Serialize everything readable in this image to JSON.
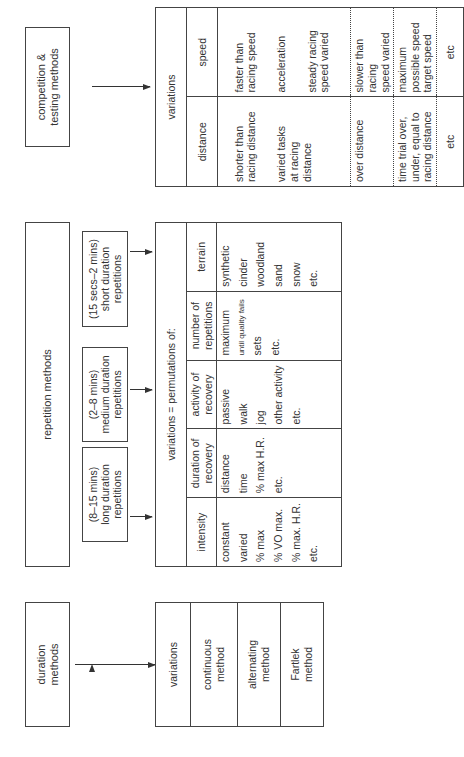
{
  "duration": {
    "title": "duration\nmethods",
    "variations_label": "variations",
    "items": [
      "continuous\nmethod",
      "alternating\nmethod",
      "Fartlek\nmethod"
    ]
  },
  "repetition": {
    "title": "repetition methods",
    "subtypes": [
      "(8–15 mins)\nlong duration\nrepetitions",
      "(2–8 mins)\nmedium duration\nrepetitions",
      "(15 secs–2 mins)\nshort duration\nrepetitions"
    ],
    "table_title": "variations = permutations of:",
    "columns": [
      {
        "header": "intensity",
        "items": [
          "constant",
          "varied",
          "% max",
          "% VO max.",
          "% max. H.R.",
          "etc."
        ]
      },
      {
        "header": "duration of\nrecovery",
        "items": [
          "distance",
          "time",
          "% max H.R.",
          "etc."
        ]
      },
      {
        "header": "activity of\nrecovery",
        "items": [
          "passive",
          "walk",
          "jog",
          "other activity",
          "etc."
        ]
      },
      {
        "header": "number of\nrepetitions",
        "items": [
          "maximum",
          "until quality fails",
          "sets",
          "etc."
        ]
      },
      {
        "header": "terrain",
        "items": [
          "synthetic",
          "cinder",
          "woodland",
          "sand",
          "snow",
          "etc."
        ]
      }
    ]
  },
  "competition": {
    "title": "competition &\ntesting methods",
    "table_title": "variations",
    "headers": [
      "distance",
      "speed"
    ],
    "rows": [
      {
        "distance": [
          "shorter than\nracing distance",
          "varied tasks\nat racing\ndistance"
        ],
        "speed": [
          "faster than\nracing speed",
          "acceleration",
          "steady racing\nspeed varied"
        ]
      },
      {
        "distance": [
          "over distance"
        ],
        "speed": [
          "slower than racing\nspeed varied"
        ]
      },
      {
        "distance": [
          "time trial over,\nunder, equal to\nracing distance"
        ],
        "speed": [
          "maximum\npossible speed\ntarget speed"
        ]
      },
      {
        "distance": [
          "etc"
        ],
        "speed": [
          "etc"
        ]
      }
    ]
  }
}
